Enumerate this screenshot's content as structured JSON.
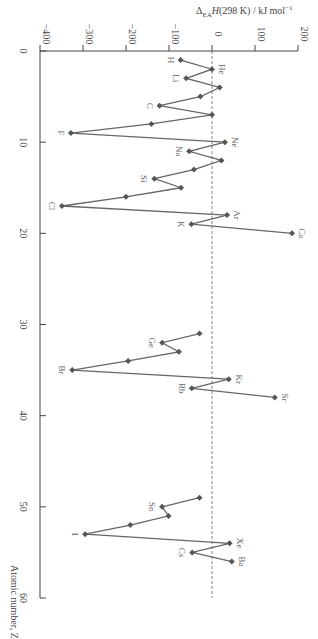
{
  "chart_data": {
    "type": "line",
    "orientation": "rotated-90-clockwise",
    "title": "",
    "xlabel": "Atomic number, Z",
    "ylabel": "ΔEA H(298 K) / kJ mol⁻¹",
    "xlim": [
      0,
      60
    ],
    "ylim": [
      -400,
      200
    ],
    "x_ticks": [
      0,
      10,
      20,
      30,
      40,
      50,
      60
    ],
    "y_ticks": [
      -400,
      -300,
      -200,
      -100,
      0,
      100,
      200
    ],
    "reference_line": {
      "value": 0,
      "style": "dashed"
    },
    "series": [
      {
        "name": "Period 1-4 segment",
        "points": [
          {
            "z": 1,
            "value": -73,
            "label": "H"
          },
          {
            "z": 2,
            "value": 0,
            "label": "He"
          },
          {
            "z": 3,
            "value": -60,
            "label": "Li"
          },
          {
            "z": 4,
            "value": 18,
            "label": ""
          },
          {
            "z": 5,
            "value": -27,
            "label": ""
          },
          {
            "z": 6,
            "value": -122,
            "label": "C"
          },
          {
            "z": 7,
            "value": 0,
            "label": ""
          },
          {
            "z": 8,
            "value": -141,
            "label": ""
          },
          {
            "z": 9,
            "value": -328,
            "label": "F"
          },
          {
            "z": 10,
            "value": 30,
            "label": "Ne"
          },
          {
            "z": 11,
            "value": -53,
            "label": "Na"
          },
          {
            "z": 12,
            "value": 22,
            "label": ""
          },
          {
            "z": 13,
            "value": -42,
            "label": ""
          },
          {
            "z": 14,
            "value": -134,
            "label": "Si"
          },
          {
            "z": 15,
            "value": -72,
            "label": ""
          },
          {
            "z": 16,
            "value": -200,
            "label": ""
          },
          {
            "z": 17,
            "value": -349,
            "label": "Cl"
          },
          {
            "z": 18,
            "value": 35,
            "label": "Ar"
          },
          {
            "z": 19,
            "value": -48,
            "label": "K"
          },
          {
            "z": 20,
            "value": 186,
            "label": "Ca"
          }
        ]
      },
      {
        "name": "Period 4-5 segment",
        "points": [
          {
            "z": 31,
            "value": -29,
            "label": ""
          },
          {
            "z": 32,
            "value": -116,
            "label": "Ge"
          },
          {
            "z": 33,
            "value": -77,
            "label": ""
          },
          {
            "z": 34,
            "value": -195,
            "label": ""
          },
          {
            "z": 35,
            "value": -325,
            "label": "Br"
          },
          {
            "z": 36,
            "value": 39,
            "label": "Kr"
          },
          {
            "z": 37,
            "value": -47,
            "label": "Rb"
          },
          {
            "z": 38,
            "value": 146,
            "label": "Sr"
          }
        ]
      },
      {
        "name": "Period 5-6 segment",
        "points": [
          {
            "z": 49,
            "value": -29,
            "label": ""
          },
          {
            "z": 50,
            "value": -116,
            "label": "Sn"
          },
          {
            "z": 51,
            "value": -101,
            "label": ""
          },
          {
            "z": 52,
            "value": -190,
            "label": ""
          },
          {
            "z": 53,
            "value": -295,
            "label": "I"
          },
          {
            "z": 54,
            "value": 41,
            "label": "Xe"
          },
          {
            "z": 55,
            "value": -46,
            "label": "Cs"
          },
          {
            "z": 56,
            "value": 46,
            "label": "Ba"
          }
        ]
      }
    ]
  },
  "labels": {
    "value_axis_title": "ΔEA H(298 K) / kJ mol⁻¹",
    "z_axis_title": "Atomic number, Z"
  }
}
